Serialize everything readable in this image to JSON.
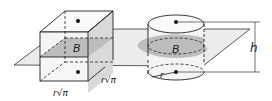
{
  "figure": {
    "prism": {
      "base_label": "B",
      "side_label_1": "r√π",
      "side_label_2": "r√π"
    },
    "cylinder": {
      "base_label": "B",
      "radius_label": "r"
    },
    "height_label": "h",
    "colors": {
      "plane": "#e6e6e6",
      "cross_section": "#bdbdbd",
      "solid_face": "#d4d4d4",
      "line": "#222222"
    }
  }
}
